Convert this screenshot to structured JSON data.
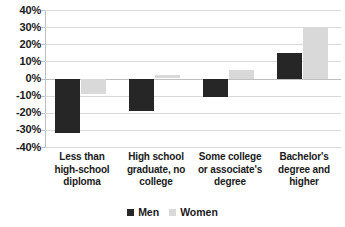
{
  "chart_data": {
    "type": "bar",
    "title": "",
    "subtitle": "",
    "xlabel": "",
    "ylabel": "",
    "ylim": [
      -40,
      40
    ],
    "ytick_step": 10,
    "ytick_labels": [
      "40%",
      "30%",
      "20%",
      "10%",
      "0%",
      "-10%",
      "-20%",
      "-30%",
      "-40%"
    ],
    "ytick_values": [
      40,
      30,
      20,
      10,
      0,
      -10,
      -20,
      -30,
      -40
    ],
    "grid": true,
    "legend_position": "bottom",
    "categories": [
      "Less than high-school diploma",
      "High school graduate, no college",
      "Some college or associate's degree",
      "Bachelor's degree and higher"
    ],
    "category_lines": [
      [
        "Less than",
        "high-school",
        "diploma"
      ],
      [
        "High school",
        "graduate, no",
        "college"
      ],
      [
        "Some college",
        "or associate's",
        "degree"
      ],
      [
        "Bachelor's",
        "degree and",
        "higher"
      ]
    ],
    "series": [
      {
        "name": "Men",
        "color": "#262626",
        "values": [
          -32,
          -19,
          -11,
          15
        ]
      },
      {
        "name": "Women",
        "color": "#d9d9d9",
        "values": [
          -9,
          2,
          5,
          30
        ]
      }
    ]
  },
  "legend": {
    "items": [
      {
        "label": "Men",
        "swatch": "men-swatch"
      },
      {
        "label": "Women",
        "swatch": "women-swatch"
      }
    ]
  },
  "colors": {
    "men": "#262626",
    "women": "#d9d9d9",
    "gridline": "#d9d9d9",
    "axis": "#bfbfbf",
    "text": "#1a1a1a",
    "background": "#ffffff"
  }
}
